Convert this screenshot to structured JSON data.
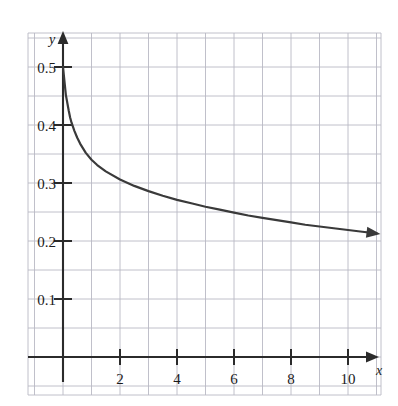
{
  "figure": {
    "background_color": "#ffffff",
    "grid_color": "#b9b9c4",
    "axis_color": "#2b2b2b",
    "curve_color": "#3a3a3a"
  },
  "axes": {
    "x_axis_label": "x",
    "y_axis_label": "y",
    "x_ticks": [
      {
        "label": "2",
        "value": 2
      },
      {
        "label": "4",
        "value": 4
      },
      {
        "label": "6",
        "value": 6
      },
      {
        "label": "8",
        "value": 8
      },
      {
        "label": "10",
        "value": 10
      }
    ],
    "y_ticks": [
      {
        "label": "0.1",
        "value": 0.1
      },
      {
        "label": "0.2",
        "value": 0.2
      },
      {
        "label": "0.3",
        "value": 0.3
      },
      {
        "label": "0.4",
        "value": 0.4
      },
      {
        "label": "0.5",
        "value": 0.5
      }
    ]
  },
  "chart_data": {
    "type": "line",
    "title": "",
    "subtitle": "",
    "xlabel": "x",
    "ylabel": "y",
    "xlim": [
      -1.2,
      11.2
    ],
    "ylim": [
      -0.045,
      0.555
    ],
    "grid": true,
    "grid_spacing_x": 1,
    "grid_spacing_y": 0.05,
    "legend": null,
    "legend_position": "none",
    "annotations": [
      "y-axis drawn as an upward arrow",
      "x-axis drawn as a rightward arrow",
      "curve terminates in a rightward arrowhead near x = 11, y = 0.2"
    ],
    "series": [
      {
        "name": "decaying curve",
        "color": "#3a3a3a",
        "marker": "none",
        "line_style": "solid",
        "arrow_end": true,
        "x": [
          0,
          0.1,
          0.2,
          0.25,
          0.3,
          0.4,
          0.5,
          0.6,
          0.8,
          1,
          1.2,
          1.5,
          2,
          2.5,
          3,
          3.5,
          4,
          4.5,
          5,
          5.5,
          6,
          6.5,
          7,
          7.5,
          8,
          8.5,
          9,
          9.5,
          10,
          10.5,
          11
        ],
        "y": [
          0.5,
          0.452,
          0.425,
          0.413,
          0.404,
          0.39,
          0.378,
          0.368,
          0.352,
          0.34,
          0.331,
          0.32,
          0.306,
          0.295,
          0.286,
          0.278,
          0.271,
          0.265,
          0.259,
          0.254,
          0.249,
          0.244,
          0.24,
          0.236,
          0.232,
          0.228,
          0.225,
          0.222,
          0.219,
          0.216,
          0.213
        ]
      }
    ],
    "key_points": [
      {
        "x": 0,
        "y": 0.5
      },
      {
        "x": 2,
        "y": 0.306
      },
      {
        "x": 4,
        "y": 0.271
      },
      {
        "x": 6,
        "y": 0.249
      },
      {
        "x": 8,
        "y": 0.232
      },
      {
        "x": 10,
        "y": 0.219
      }
    ]
  }
}
